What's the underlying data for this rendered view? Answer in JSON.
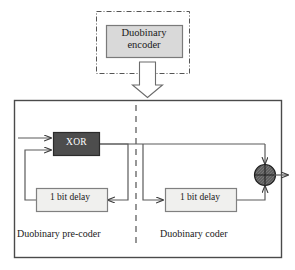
{
  "diagram": {
    "top_block": {
      "name": "duobinary-encoder",
      "label_line1": "Duobinary",
      "label_line2": "encoder",
      "label": "Duobinary encoder",
      "fill": "#d9d9d9",
      "stroke": "#7a7a7a",
      "container_border_style": "dash-dot",
      "container_stroke": "#555555"
    },
    "flow_arrow": {
      "name": "down-arrow",
      "direction": "down",
      "style": "hollow-block",
      "stroke": "#6b6b6b",
      "fill": "#ffffff"
    },
    "main_block": {
      "name": "encoder-body",
      "stroke": "#4a4a4a",
      "fill": "#ffffff",
      "divider_style": "dashed",
      "divider_stroke": "#6b6b6b"
    },
    "blocks": [
      {
        "name": "xor-gate",
        "label": "XOR",
        "fill": "#4d4d4d",
        "stroke": "#2b2b2b",
        "text_color": "#ffffff"
      },
      {
        "name": "delay-left",
        "label": "1 bit delay",
        "fill": "#f0f0ee",
        "stroke": "#808080",
        "text_color": "#1a1a1a"
      },
      {
        "name": "delay-right",
        "label": "1 bit delay",
        "fill": "#f0f0ee",
        "stroke": "#808080",
        "text_color": "#1a1a1a"
      }
    ],
    "adder": {
      "name": "summing-junction",
      "symbol": "cross",
      "fill": "#5a5a5a",
      "stroke": "#1f1f1f"
    },
    "section_labels": [
      {
        "name": "precoder-section-label",
        "label": "Duobinary pre-coder"
      },
      {
        "name": "coder-section-label",
        "label": "Duobinary coder"
      }
    ],
    "wire_stroke": "#5a5a5a"
  }
}
